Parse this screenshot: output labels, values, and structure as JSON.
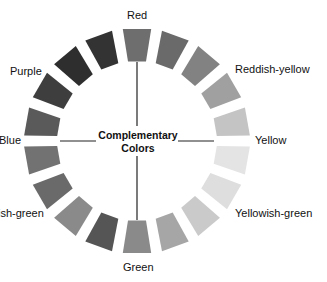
{
  "diagram": {
    "title_line1": "Complementary",
    "title_line2": "Colors",
    "labels": {
      "red": "Red",
      "reddish_yellow": "Reddish-yellow",
      "yellow": "Yellow",
      "yellowish_green": "Yellowish-green",
      "green": "Green",
      "bluish_green": "ish-green",
      "blue": "Blue",
      "purple": "Purple"
    },
    "segments": [
      {
        "position": "top (Red)",
        "angle": 0,
        "color": "#6e6e6e"
      },
      {
        "angle": 20,
        "color": "#6a6a6a"
      },
      {
        "angle": 40,
        "color": "#828282"
      },
      {
        "angle": 60,
        "color": "#a0a0a0"
      },
      {
        "angle": 80,
        "color": "#c4c4c4"
      },
      {
        "position": "right (Yellow)",
        "angle": 100,
        "color": "#e2e2e2"
      },
      {
        "angle": 120,
        "color": "#dedede"
      },
      {
        "angle": 140,
        "color": "#cacaca"
      },
      {
        "angle": 160,
        "color": "#a6a6a6"
      },
      {
        "angle": 180,
        "color": "#8a8a8a",
        "position": "bottom-right"
      },
      {
        "position": "bottom (Green)",
        "angle": 180,
        "color": "#555555"
      },
      {
        "angle": 200,
        "color": "#8a8a8a"
      },
      {
        "angle": 220,
        "color": "#6a6a6a"
      },
      {
        "angle": 240,
        "color": "#727272"
      },
      {
        "angle": 260,
        "color": "#5a5a5a"
      },
      {
        "position": "left (Blue)",
        "angle": 270,
        "color": "#3e3e3e"
      },
      {
        "angle": 290,
        "color": "#383838"
      },
      {
        "angle": 310,
        "color": "#2a2a2a"
      },
      {
        "angle": 330,
        "color": "#303030"
      },
      {
        "angle": 350,
        "color": "#3a3a3a"
      }
    ]
  }
}
